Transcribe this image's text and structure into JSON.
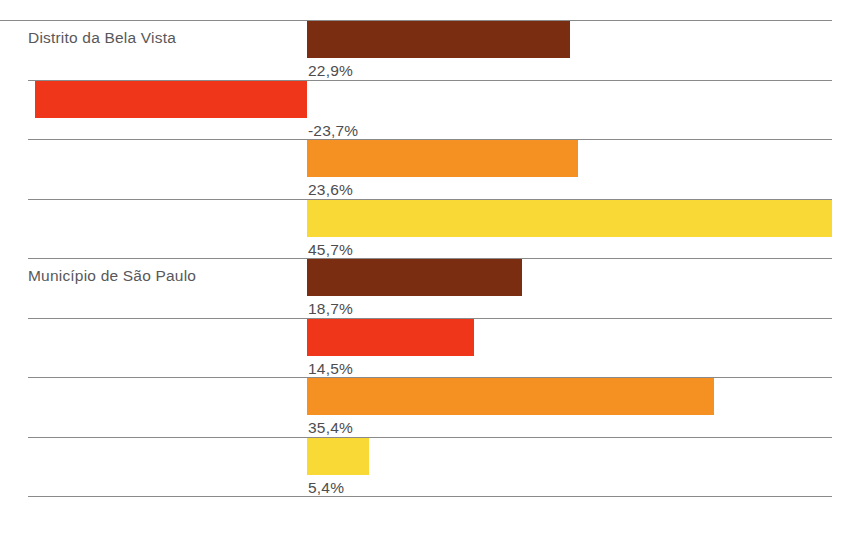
{
  "chart_data": {
    "type": "bar",
    "title": "",
    "subtitle": "",
    "xlabel": "",
    "ylabel": "",
    "orientation": "horizontal",
    "grid": true,
    "legend": null,
    "value_suffix": "%",
    "decimal_separator": ",",
    "zero_line_x_px": 307,
    "px_per_percent": 11.49,
    "xlim": [
      -23.7,
      45.7
    ],
    "groups": [
      {
        "label": "Distrito da Bela Vista",
        "bars": [
          {
            "value": 22.9,
            "label": "22,9%",
            "color": "#7B2D12"
          },
          {
            "value": -23.7,
            "label": "-23,7%",
            "color": "#F0361A"
          },
          {
            "value": 23.6,
            "label": "23,6%",
            "color": "#F59122"
          },
          {
            "value": 45.7,
            "label": "45,7%",
            "color": "#F8D936"
          }
        ]
      },
      {
        "label": "Município de São Paulo",
        "bars": [
          {
            "value": 18.7,
            "label": "18,7%",
            "color": "#7B2D12"
          },
          {
            "value": 14.5,
            "label": "14,5%",
            "color": "#F0361A"
          },
          {
            "value": 35.4,
            "label": "35,4%",
            "color": "#F59122"
          },
          {
            "value": 5.4,
            "label": "5,4%",
            "color": "#F8D936"
          }
        ]
      }
    ],
    "categories": [
      "Distrito da Bela Vista - serie 1",
      "Distrito da Bela Vista - serie 2",
      "Distrito da Bela Vista - serie 3",
      "Distrito da Bela Vista - serie 4",
      "Município de São Paulo - serie 1",
      "Município de São Paulo - serie 2",
      "Município de São Paulo - serie 3",
      "Município de São Paulo - serie 4"
    ],
    "values": [
      22.9,
      -23.7,
      23.6,
      45.7,
      18.7,
      14.5,
      35.4,
      5.4
    ],
    "value_labels": [
      "22,9%",
      "-23,7%",
      "23,6%",
      "45,7%",
      "18,7%",
      "14,5%",
      "35,4%",
      "5,4%"
    ],
    "series_colors": [
      "#7B2D12",
      "#F0361A",
      "#F59122",
      "#F8D936"
    ]
  },
  "colors": {
    "gridline": "#8a8a8a",
    "label_text": "#58585a",
    "value_text": "#4d4d4f",
    "background": "#ffffff",
    "series_dark_brown": "#7B2D12",
    "series_red": "#F0361A",
    "series_orange": "#F59122",
    "series_yellow": "#F8D936"
  }
}
